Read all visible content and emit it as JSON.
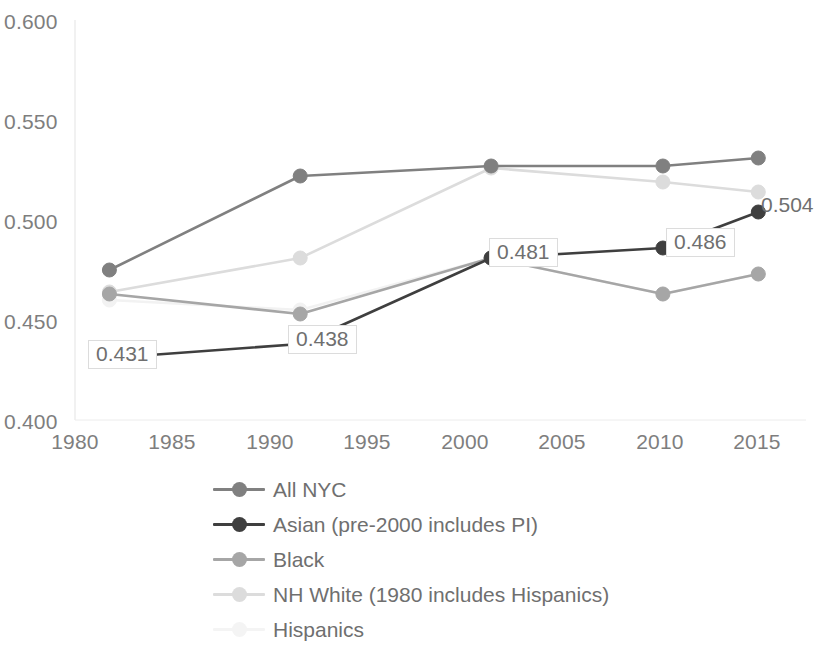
{
  "chart_data": {
    "type": "line",
    "title": "",
    "xlabel": "",
    "ylabel": "",
    "x": [
      1980,
      1990,
      2000,
      2009,
      2014
    ],
    "xlim": [
      1978.2,
      2016.5
    ],
    "ylim": [
      0.4,
      0.6
    ],
    "xticks": [
      "1980",
      "1985",
      "1990",
      "1995",
      "2000",
      "2005",
      "2010",
      "2015"
    ],
    "xtick_values": [
      1980,
      1985,
      1990,
      1995,
      2000,
      2005,
      2010,
      2015
    ],
    "yticks": [
      "0.600",
      "0.550",
      "0.500",
      "0.450",
      "0.400"
    ],
    "ytick_values": [
      0.6,
      0.55,
      0.5,
      0.45,
      0.4
    ],
    "grid": false,
    "legend_position": "bottom",
    "series": [
      {
        "name": "All NYC",
        "color": "#808080",
        "x": [
          1980,
          1990,
          2000,
          2009,
          2014
        ],
        "values": [
          0.475,
          0.522,
          0.527,
          0.527,
          0.531
        ]
      },
      {
        "name": "Asian (pre-2000 includes PI)",
        "color": "#3f3f3f",
        "x": [
          1980,
          1990,
          2000,
          2009,
          2014
        ],
        "values": [
          0.431,
          0.438,
          0.481,
          0.486,
          0.504
        ],
        "labels": [
          "0.431",
          "0.438",
          "0.481",
          "0.486",
          "0.504"
        ]
      },
      {
        "name": "Black",
        "color": "#a6a6a6",
        "x": [
          1980,
          1990,
          2000,
          2009,
          2014
        ],
        "values": [
          0.463,
          0.453,
          0.481,
          0.463,
          0.473
        ]
      },
      {
        "name": "NH White (1980 includes Hispanics)",
        "color": "#dcdcdc",
        "x": [
          1980,
          1990,
          2000,
          2009,
          2014
        ],
        "values": [
          0.464,
          0.481,
          0.526,
          0.519,
          0.514
        ]
      },
      {
        "name": "Hispanics",
        "color": "#f2f2f2",
        "x": [
          1980,
          1990,
          2000,
          2009,
          2014
        ],
        "values": [
          0.46,
          0.455,
          0.481,
          0.463,
          0.473
        ]
      }
    ],
    "data_labels": [
      {
        "text": "0.431",
        "series": "Asian (pre-2000 includes PI)",
        "x": 1980,
        "y": 0.431
      },
      {
        "text": "0.438",
        "series": "Asian (pre-2000 includes PI)",
        "x": 1990,
        "y": 0.438
      },
      {
        "text": "0.481",
        "series": "Asian (pre-2000 includes PI)",
        "x": 2000,
        "y": 0.481
      },
      {
        "text": "0.486",
        "series": "Asian (pre-2000 includes PI)",
        "x": 2009,
        "y": 0.486
      },
      {
        "text": "0.504",
        "series": "Asian (pre-2000 includes PI)",
        "x": 2014,
        "y": 0.504
      }
    ]
  },
  "axis": {
    "y_labels": [
      "0.600",
      "0.550",
      "0.500",
      "0.450",
      "0.400"
    ],
    "x_labels": [
      "1980",
      "1985",
      "1990",
      "1995",
      "2000",
      "2005",
      "2010",
      "2015"
    ]
  },
  "legend": {
    "items": [
      {
        "label": "All NYC",
        "color": "#808080"
      },
      {
        "label": "Asian (pre-2000 includes PI)",
        "color": "#3f3f3f"
      },
      {
        "label": "Black",
        "color": "#a6a6a6"
      },
      {
        "label": "NH White (1980 includes Hispanics)",
        "color": "#dcdcdc"
      },
      {
        "label": "Hispanics",
        "color": "#f4f4f4"
      }
    ]
  },
  "labels": {
    "l431": "0.431",
    "l438": "0.438",
    "l481": "0.481",
    "l486": "0.486",
    "l504": "0.504"
  }
}
